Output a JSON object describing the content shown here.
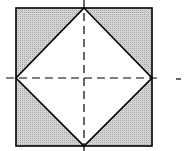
{
  "diagram": {
    "colors": {
      "background": "#ffffff",
      "shade": "#c8c8c8",
      "stroke": "#000000"
    },
    "square": {
      "x": 16,
      "y": 8,
      "size": 136
    },
    "diamond_vertices": [
      [
        84,
        8
      ],
      [
        152,
        77
      ],
      [
        84,
        146
      ],
      [
        16,
        77
      ]
    ],
    "dashed_lines": [
      {
        "orientation": "vertical",
        "x": 84,
        "y1": 0,
        "y2": 151
      },
      {
        "orientation": "horizontal",
        "y": 77,
        "x1": 6,
        "x2": 162
      }
    ],
    "stray_mark": {
      "x1": 176,
      "x2": 181,
      "y": 78
    }
  }
}
